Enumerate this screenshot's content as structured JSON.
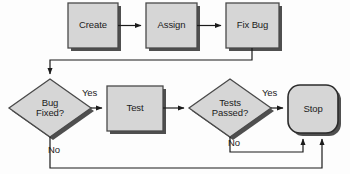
{
  "diagram": {
    "colors": {
      "node_fill": "#d6d6d6",
      "node_fill_light": "#e2e2e2",
      "node_border": "#4a4a4a",
      "shadow": "#4f4f4f",
      "connector": "#1b1b1b",
      "background": "#fdfdfd",
      "text": "#1b1b1b"
    },
    "nodes": [
      {
        "id": "create",
        "label": "Create",
        "shape": "rectangle"
      },
      {
        "id": "assign",
        "label": "Assign",
        "shape": "rectangle"
      },
      {
        "id": "fix_bug",
        "label": "Fix Bug",
        "shape": "rectangle"
      },
      {
        "id": "bug_fixed",
        "label": "Bug\nFixed?",
        "shape": "diamond"
      },
      {
        "id": "test",
        "label": "Test",
        "shape": "rectangle"
      },
      {
        "id": "tests_passed",
        "label": "Tests\nPassed?",
        "shape": "diamond"
      },
      {
        "id": "stop",
        "label": "Stop",
        "shape": "rounded-rectangle"
      }
    ],
    "edges": [
      {
        "id": "create-assign",
        "from": "create",
        "to": "assign",
        "label": ""
      },
      {
        "id": "assign-fixbug",
        "from": "assign",
        "to": "fix_bug",
        "label": ""
      },
      {
        "id": "fixbug-bugfixed",
        "from": "fix_bug",
        "to": "bug_fixed",
        "label": ""
      },
      {
        "id": "bugfixed-test",
        "from": "bug_fixed",
        "to": "test",
        "label": "Yes"
      },
      {
        "id": "bugfixed-stop",
        "from": "bug_fixed",
        "to": "stop",
        "label": "No"
      },
      {
        "id": "test-testspassed",
        "from": "test",
        "to": "tests_passed",
        "label": ""
      },
      {
        "id": "testspassed-stop",
        "from": "tests_passed",
        "to": "stop",
        "label": "Yes"
      },
      {
        "id": "testspassed-stop-no",
        "from": "tests_passed",
        "to": "stop",
        "label": "No"
      }
    ],
    "labels": {
      "yes_bug_fixed": "Yes",
      "no_bug_fixed": "No",
      "yes_tests_passed": "Yes",
      "no_tests_passed": "No"
    }
  }
}
